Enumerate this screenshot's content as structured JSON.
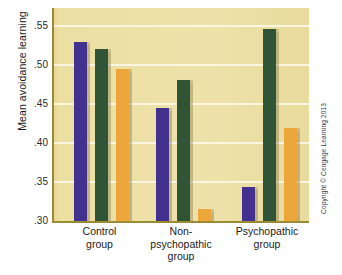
{
  "figure": {
    "copyright": "Copyright © Cengage Learning 2013"
  },
  "chart_data": {
    "type": "bar",
    "title": "",
    "xlabel": "",
    "ylabel": "Mean avoidance learning",
    "ylim": [
      0.3,
      0.5725
    ],
    "yticks": [
      ".30",
      ".35",
      ".40",
      ".45",
      ".50",
      ".55"
    ],
    "ytick_values": [
      0.3,
      0.35,
      0.4,
      0.45,
      0.5,
      0.55
    ],
    "grid": true,
    "legend": "none",
    "categories": [
      "Control group",
      "Non-psychopathic group",
      "Psychopathic group"
    ],
    "category_lines": [
      [
        "Control",
        "group"
      ],
      [
        "Non-",
        "psychopathic",
        "group"
      ],
      [
        "Psychopathic",
        "group"
      ]
    ],
    "series": [
      {
        "name": "series-1",
        "color": "#42318f",
        "values": [
          0.529,
          0.445,
          0.344
        ]
      },
      {
        "name": "series-2",
        "color": "#2f5436",
        "values": [
          0.52,
          0.481,
          0.546
        ]
      },
      {
        "name": "series-3",
        "color": "#eda63c",
        "values": [
          0.495,
          0.315,
          0.419
        ]
      }
    ],
    "colors": {
      "plot_background": "#ecdfa2",
      "gridline": "#fbf6e4",
      "axis": "#9c8b33",
      "series_1": "#42318f",
      "series_2": "#2f5436",
      "series_3": "#eda63c"
    }
  }
}
